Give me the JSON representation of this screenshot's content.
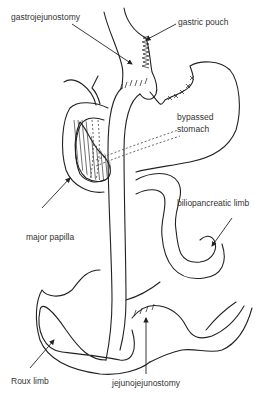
{
  "diagram": {
    "type": "anatomical-illustration",
    "labels": {
      "gastrojejunostomy": "gastrojejunostomy",
      "gastric_pouch": "gastric pouch",
      "bypassed_stomach_line1": "bypassed",
      "bypassed_stomach_line2": "stomach",
      "major_papilla": "major papilla",
      "biliopancreatic_limb": "biliopancreatic limb",
      "roux_limb": "Roux limb",
      "jejunojejunostomy": "jejunojejunostomy"
    },
    "colors": {
      "line": "#222222",
      "text": "#333333",
      "background": "#ffffff"
    }
  }
}
